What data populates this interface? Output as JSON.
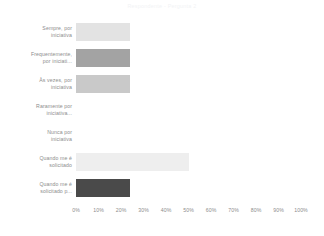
{
  "chart_title": "Respondente - Pergunta 2",
  "axis": {
    "x_ticks": [
      "0%",
      "10%",
      "20%",
      "30%",
      "40%",
      "50%",
      "60%",
      "70%",
      "80%",
      "90%",
      "100%"
    ],
    "x_min": 0,
    "x_max": 100,
    "x_label": "",
    "y_label": ""
  },
  "chart_data": {
    "type": "bar",
    "orientation": "horizontal",
    "title": "Respondente - Pergunta 2",
    "xlabel": "",
    "ylabel": "",
    "xlim": [
      0,
      100
    ],
    "grid": false,
    "legend": "none",
    "categories": [
      "Sempre, por\niniciativa",
      "Frequentemente,\npor iniciati...",
      "Às vezes, por\niniciativa",
      "Raramente por\niniciativa...",
      "Nunca por\niniciativa",
      "Quando me é\nsolicitado",
      "Quando me é\nsolicitado p..."
    ],
    "values": [
      24,
      24,
      24,
      0,
      0,
      50,
      24
    ],
    "colors": [
      "#e3e3e3",
      "#a3a3a3",
      "#c9c9c9",
      "#d9d9d9",
      "#d9d9d9",
      "#eeeeee",
      "#4a4a4a"
    ],
    "x_tick_labels": [
      "0%",
      "10%",
      "20%",
      "30%",
      "40%",
      "50%",
      "60%",
      "70%",
      "80%",
      "90%",
      "100%"
    ]
  },
  "bars": [
    {
      "label": "Sempre, por\niniciativa",
      "value": 24,
      "color": "#e3e3e3"
    },
    {
      "label": "Frequentemente,\npor iniciati...",
      "value": 24,
      "color": "#a3a3a3"
    },
    {
      "label": "Às vezes, por\niniciativa",
      "value": 24,
      "color": "#c9c9c9"
    },
    {
      "label": "Raramente por\niniciativa...",
      "value": 0,
      "color": "#d9d9d9"
    },
    {
      "label": "Nunca por\niniciativa",
      "value": 0,
      "color": "#d9d9d9"
    },
    {
      "label": "Quando me é\nsolicitado",
      "value": 50,
      "color": "#eeeeee"
    },
    {
      "label": "Quando me é\nsolicitado p...",
      "value": 24,
      "color": "#4a4a4a"
    }
  ]
}
